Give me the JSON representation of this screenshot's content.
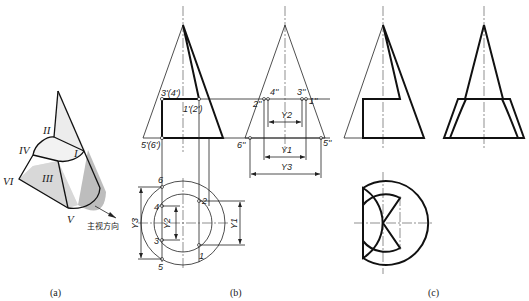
{
  "figure": {
    "panels": [
      {
        "id": "a",
        "caption": "(a)"
      },
      {
        "id": "b",
        "caption": "(b)"
      },
      {
        "id": "c",
        "caption": "(c)"
      }
    ],
    "panel_a": {
      "face_labels": [
        "I",
        "II",
        "III",
        "IV",
        "V",
        "VI"
      ],
      "view_direction_label": "主视方向"
    },
    "panel_b": {
      "front_view_points": [
        "3'(4')",
        "1'(2')",
        "5'(6')"
      ],
      "side_view_points": [
        "4''",
        "3''",
        "2''",
        "1''",
        "6''",
        "5''"
      ],
      "top_view_points": [
        "1",
        "2",
        "3",
        "4",
        "5",
        "6"
      ],
      "dimensions": [
        "Y2",
        "Y1",
        "Y3"
      ]
    }
  }
}
